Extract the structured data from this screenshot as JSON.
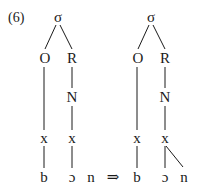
{
  "example_number": "(6)",
  "arrow": "⇒",
  "left_tree": {
    "syllable": "σ",
    "onset": "O",
    "rime": "R",
    "nucleus": "N",
    "skeleton": [
      "x",
      "x"
    ],
    "segments": [
      "b",
      "ɔ",
      "n"
    ]
  },
  "right_tree": {
    "syllable": "σ",
    "onset": "O",
    "rime": "R",
    "nucleus": "N",
    "skeleton": [
      "x",
      "x"
    ],
    "segments": [
      "b",
      "ɔ",
      "n"
    ]
  }
}
